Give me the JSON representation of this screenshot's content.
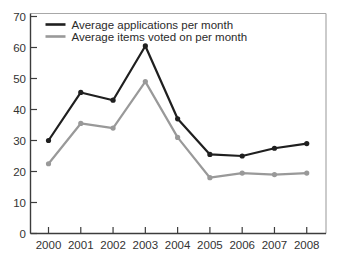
{
  "chart_data": {
    "type": "line",
    "title": "",
    "xlabel": "",
    "ylabel": "",
    "x": [
      2000,
      2001,
      2002,
      2003,
      2004,
      2005,
      2006,
      2007,
      2008
    ],
    "x_tick_labels": [
      "2000",
      "2001",
      "2002",
      "2003",
      "2004",
      "2005",
      "2006",
      "2007",
      "2008"
    ],
    "y_ticks": [
      0,
      10,
      20,
      30,
      40,
      50,
      60,
      70
    ],
    "ylim": [
      0,
      70
    ],
    "grid": false,
    "markers": true,
    "legend_position": "top-left",
    "series": [
      {
        "name": "Average applications per month",
        "color": "#1f1f1f",
        "values": [
          30,
          45.5,
          43,
          60.5,
          37,
          25.5,
          25,
          27.5,
          29
        ]
      },
      {
        "name": "Average items voted on per month",
        "color": "#999999",
        "values": [
          22.5,
          35.5,
          34,
          49,
          31,
          18,
          19.5,
          19,
          19.5
        ]
      }
    ]
  },
  "colors": {
    "background": "#ffffff",
    "spine_dark": "#3c3c3c",
    "spine_light": "#a8a8a8",
    "tick_mark": "#3c3c3c",
    "tick_label": "#333333",
    "legend_text": "#2b2b2b"
  }
}
